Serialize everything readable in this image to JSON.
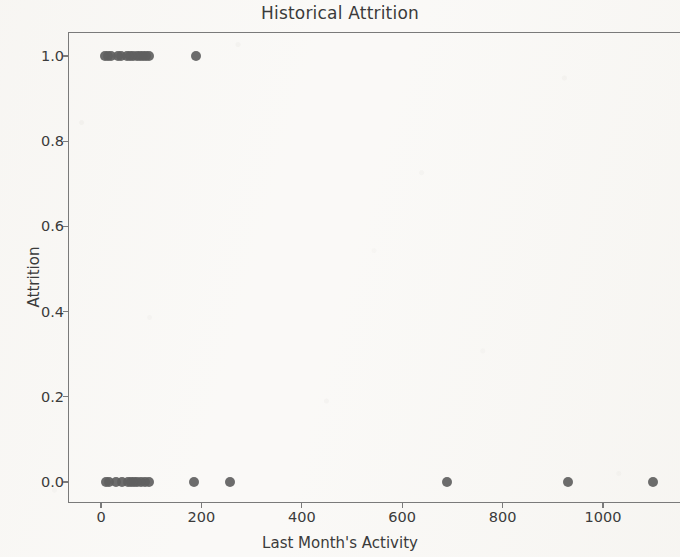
{
  "chart_data": {
    "type": "scatter",
    "title": "Historical Attrition",
    "xlabel": "Last Month's Activity",
    "ylabel": "Attrition",
    "xlim": [
      -60,
      1160
    ],
    "ylim": [
      -0.06,
      1.06
    ],
    "grid": false,
    "legend": null,
    "marker_color": "#606060",
    "marker_size": 10,
    "xticks": [
      0,
      200,
      400,
      600,
      800,
      1000
    ],
    "xtick_labels": [
      "0",
      "200",
      "400",
      "600",
      "800",
      "1000"
    ],
    "yticks": [
      0.0,
      0.2,
      0.4,
      0.6,
      0.8,
      1.0
    ],
    "ytick_labels": [
      "0.0",
      "0.2",
      "0.4",
      "0.6",
      "0.8",
      "1.0"
    ],
    "series": [
      {
        "name": "Attrition observations",
        "x": [
          8,
          14,
          20,
          34,
          40,
          52,
          58,
          64,
          72,
          78,
          84,
          90,
          96,
          190,
          10,
          16,
          30,
          42,
          54,
          60,
          66,
          72,
          80,
          88,
          96,
          185,
          257,
          690,
          930,
          1100
        ],
        "y": [
          1,
          1,
          1,
          1,
          1,
          1,
          1,
          1,
          1,
          1,
          1,
          1,
          1,
          1,
          0,
          0,
          0,
          0,
          0,
          0,
          0,
          0,
          0,
          0,
          0,
          0,
          0,
          0,
          0,
          0
        ]
      }
    ]
  },
  "figure": {
    "background_color": "#faf9f7",
    "axis_color": "#7a7a7a",
    "text_color": "#3b3b3b"
  }
}
